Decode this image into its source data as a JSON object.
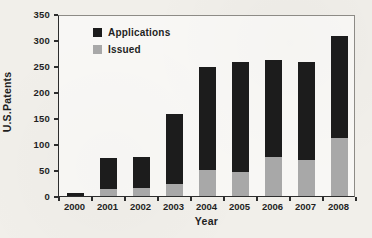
{
  "figure": {
    "y_axis_label": "U.S.Patents",
    "x_axis_label": "Year"
  },
  "chart_data": {
    "type": "bar",
    "subtype": "overlay (gray Issued bar drawn in front of black Applications bar)",
    "title": "",
    "xlabel": "Year",
    "ylabel": "U.S.Patents",
    "categories": [
      "2000",
      "2001",
      "2002",
      "2003",
      "2004",
      "2005",
      "2006",
      "2007",
      "2008"
    ],
    "series": [
      {
        "name": "Applications",
        "color": "#1c1c1c",
        "values": [
          5,
          73,
          75,
          157,
          249,
          257,
          262,
          257,
          308
        ]
      },
      {
        "name": "Issued",
        "color": "#a8a8a8",
        "values": [
          0,
          13,
          15,
          23,
          50,
          47,
          75,
          70,
          112
        ]
      }
    ],
    "ylim": [
      0,
      350
    ],
    "yticks": [
      0,
      50,
      100,
      150,
      200,
      250,
      300,
      350
    ],
    "grid": false,
    "legend_position": "upper-left-inside",
    "background_color": "#f1efea",
    "legend": [
      {
        "label": "Applications",
        "color": "#1c1c1c"
      },
      {
        "label": "Issued",
        "color": "#a8a8a8"
      }
    ]
  }
}
